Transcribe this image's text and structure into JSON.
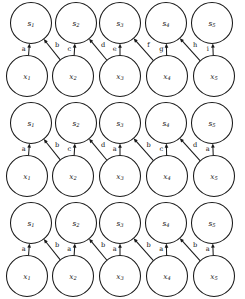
{
  "figure": {
    "node_prefix_top": "s",
    "node_prefix_bottom": "x",
    "indices": [
      1,
      2,
      3,
      4,
      5
    ],
    "geometry": {
      "width": 245,
      "height": 299,
      "radius": 20.5,
      "top_centers_x": [
        31,
        76,
        120,
        166,
        212
      ],
      "bottom_centers_x": [
        27,
        73,
        120,
        167,
        214
      ],
      "row_tops_y": [
        0,
        100,
        200
      ],
      "top_center_y": 23,
      "bottom_center_y": 76
    },
    "rows": [
      {
        "name": "row-1-all-distinct",
        "nodes_top": [
          "s1",
          "s2",
          "s3",
          "s4",
          "s5"
        ],
        "nodes_bottom": [
          "x1",
          "x2",
          "x3",
          "x4",
          "x5"
        ],
        "edges": [
          {
            "from": "x1",
            "to": "s1",
            "kind": "vertical",
            "label": "a"
          },
          {
            "from": "x2",
            "to": "s1",
            "kind": "diagonal",
            "label": "b"
          },
          {
            "from": "x2",
            "to": "s2",
            "kind": "vertical",
            "label": "c"
          },
          {
            "from": "x3",
            "to": "s2",
            "kind": "diagonal",
            "label": "d"
          },
          {
            "from": "x3",
            "to": "s3",
            "kind": "vertical",
            "label": "e"
          },
          {
            "from": "x4",
            "to": "s3",
            "kind": "diagonal",
            "label": "f"
          },
          {
            "from": "x4",
            "to": "s4",
            "kind": "vertical",
            "label": "g"
          },
          {
            "from": "x5",
            "to": "s4",
            "kind": "diagonal",
            "label": "h"
          },
          {
            "from": "x5",
            "to": "s5",
            "kind": "vertical",
            "label": "i"
          }
        ]
      },
      {
        "name": "row-2-four-symbols",
        "nodes_top": [
          "s1",
          "s2",
          "s3",
          "s4",
          "s5"
        ],
        "nodes_bottom": [
          "x1",
          "x2",
          "x3",
          "x4",
          "x5"
        ],
        "edges": [
          {
            "from": "x1",
            "to": "s1",
            "kind": "vertical",
            "label": "a"
          },
          {
            "from": "x2",
            "to": "s1",
            "kind": "diagonal",
            "label": "b"
          },
          {
            "from": "x2",
            "to": "s2",
            "kind": "vertical",
            "label": "c"
          },
          {
            "from": "x3",
            "to": "s2",
            "kind": "diagonal",
            "label": "d"
          },
          {
            "from": "x3",
            "to": "s3",
            "kind": "vertical",
            "label": "a"
          },
          {
            "from": "x4",
            "to": "s3",
            "kind": "diagonal",
            "label": "b"
          },
          {
            "from": "x4",
            "to": "s4",
            "kind": "vertical",
            "label": "c"
          },
          {
            "from": "x5",
            "to": "s4",
            "kind": "diagonal",
            "label": "d"
          },
          {
            "from": "x5",
            "to": "s5",
            "kind": "vertical",
            "label": "a"
          }
        ]
      },
      {
        "name": "row-3-two-symbols",
        "nodes_top": [
          "s1",
          "s2",
          "s3",
          "s4",
          "s5"
        ],
        "nodes_bottom": [
          "x1",
          "x2",
          "x3",
          "x4",
          "x5"
        ],
        "edges": [
          {
            "from": "x1",
            "to": "s1",
            "kind": "vertical",
            "label": "a"
          },
          {
            "from": "x2",
            "to": "s1",
            "kind": "diagonal",
            "label": "b"
          },
          {
            "from": "x2",
            "to": "s2",
            "kind": "vertical",
            "label": "a"
          },
          {
            "from": "x3",
            "to": "s2",
            "kind": "diagonal",
            "label": "b"
          },
          {
            "from": "x3",
            "to": "s3",
            "kind": "vertical",
            "label": "a"
          },
          {
            "from": "x4",
            "to": "s3",
            "kind": "diagonal",
            "label": "b"
          },
          {
            "from": "x4",
            "to": "s4",
            "kind": "vertical",
            "label": "a"
          },
          {
            "from": "x5",
            "to": "s4",
            "kind": "diagonal",
            "label": "b"
          },
          {
            "from": "x5",
            "to": "s5",
            "kind": "vertical",
            "label": "a"
          }
        ]
      }
    ],
    "colors": {
      "stroke": "#1a1a1a",
      "text": "#111111",
      "background": "#ffffff"
    }
  }
}
